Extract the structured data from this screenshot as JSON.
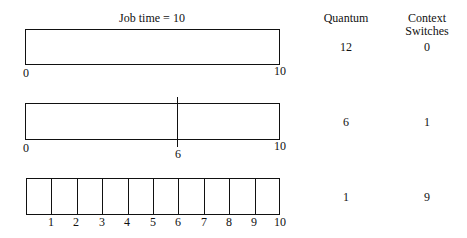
{
  "title": "Job time = 10",
  "headers": {
    "quantum": "Quantum",
    "context_switches_line1": "Context",
    "context_switches_line2": "Switches"
  },
  "rows": [
    {
      "quantum": "12",
      "context_switches": "0",
      "start_label": "0",
      "end_label": "10",
      "split_labels": []
    },
    {
      "quantum": "6",
      "context_switches": "1",
      "start_label": "0",
      "end_label": "10",
      "split_labels": [
        "6"
      ]
    },
    {
      "quantum": "1",
      "context_switches": "9",
      "start_label": "",
      "end_label": "10",
      "split_labels": [
        "1",
        "2",
        "3",
        "4",
        "5",
        "6",
        "7",
        "8",
        "9"
      ]
    }
  ],
  "colors": {
    "line": "#111111",
    "background": "#ffffff"
  }
}
